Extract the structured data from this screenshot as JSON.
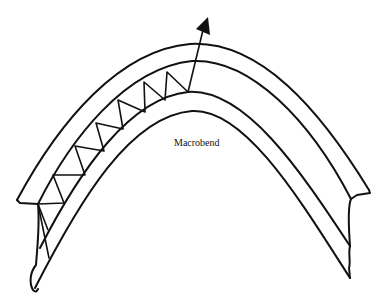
{
  "diagram": {
    "title": "Macrobend",
    "label": "Macrobend",
    "colors": {
      "line": "#111111",
      "background": "#ffffff"
    },
    "elements": [
      {
        "name": "cladding-outer-boundary",
        "kind": "curve"
      },
      {
        "name": "core-upper-boundary",
        "kind": "curve"
      },
      {
        "name": "core-lower-boundary",
        "kind": "curve"
      },
      {
        "name": "cladding-inner-boundary",
        "kind": "curve"
      },
      {
        "name": "zigzag-light-ray",
        "kind": "polyline"
      },
      {
        "name": "escaping-ray-arrow",
        "kind": "arrow"
      }
    ]
  }
}
